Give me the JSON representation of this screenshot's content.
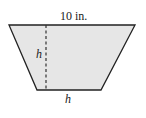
{
  "diagram": {
    "shape": "trapezoid",
    "fill_color": "#e6e6e6",
    "stroke_color": "#222222",
    "top_label": "10 in.",
    "height_label": "h",
    "bottom_label": "h",
    "vertices": {
      "top_left": [
        9,
        25
      ],
      "top_right": [
        135,
        25
      ],
      "bottom_right": [
        101,
        90
      ],
      "bottom_left": [
        37,
        90
      ]
    },
    "height_line": {
      "x": 46,
      "y1": 25,
      "y2": 90,
      "style": "dashed"
    }
  }
}
